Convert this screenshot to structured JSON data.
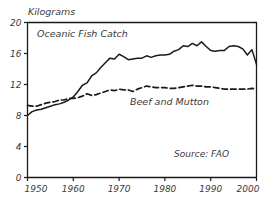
{
  "chart_data": {
    "type": "line",
    "title": "",
    "ylabel": "Kilograms",
    "xlabel": "",
    "xlim": [
      1950,
      2000
    ],
    "ylim": [
      0,
      20
    ],
    "grid": false,
    "legend_position": "inline-annotations",
    "yticks": [
      "0",
      "4",
      "8",
      "12",
      "16",
      "20"
    ],
    "ytick_values": [
      0,
      4,
      8,
      12,
      16,
      20
    ],
    "xticks": [
      "1950",
      "1960",
      "1970",
      "1980",
      "1990",
      "2000"
    ],
    "xtick_values": [
      1950,
      1960,
      1970,
      1980,
      1990,
      2000
    ],
    "annotations": [
      {
        "text": "Oceanic Fish Catch",
        "x": 1962,
        "y": 18.1
      },
      {
        "text": "Beef and Mutton",
        "x": 1981,
        "y": 9.3
      },
      {
        "text": "Source: FAO",
        "x": 1988,
        "y": 2.6
      }
    ],
    "series": [
      {
        "name": "Oceanic Fish Catch",
        "style": "solid",
        "color": "#1a1a1a",
        "x": [
          1950,
          1951,
          1952,
          1953,
          1954,
          1955,
          1956,
          1957,
          1958,
          1959,
          1960,
          1961,
          1962,
          1963,
          1964,
          1965,
          1966,
          1967,
          1968,
          1969,
          1970,
          1971,
          1972,
          1973,
          1974,
          1975,
          1976,
          1977,
          1978,
          1979,
          1980,
          1981,
          1982,
          1983,
          1984,
          1985,
          1986,
          1987,
          1988,
          1989,
          1990,
          1991,
          1992,
          1993,
          1994,
          1995,
          1996,
          1997,
          1998,
          1999,
          2000
        ],
        "values": [
          8.0,
          8.5,
          8.7,
          8.8,
          9.0,
          9.2,
          9.4,
          9.5,
          9.7,
          10.0,
          10.4,
          11.1,
          11.9,
          12.2,
          13.1,
          13.5,
          14.2,
          14.8,
          15.4,
          15.3,
          15.9,
          15.6,
          15.2,
          15.3,
          15.4,
          15.4,
          15.7,
          15.5,
          15.7,
          15.8,
          15.8,
          15.9,
          16.3,
          16.5,
          17.0,
          16.9,
          17.3,
          17.0,
          17.5,
          16.9,
          16.4,
          16.3,
          16.4,
          16.4,
          16.9,
          17.0,
          16.9,
          16.6,
          15.8,
          16.5,
          14.6
        ]
      },
      {
        "name": "Beef and Mutton",
        "style": "dashed",
        "color": "#1a1a1a",
        "x": [
          1950,
          1951,
          1952,
          1953,
          1954,
          1955,
          1956,
          1957,
          1958,
          1959,
          1960,
          1961,
          1962,
          1963,
          1964,
          1965,
          1966,
          1967,
          1968,
          1969,
          1970,
          1971,
          1972,
          1973,
          1974,
          1975,
          1976,
          1977,
          1978,
          1979,
          1980,
          1981,
          1982,
          1983,
          1984,
          1985,
          1986,
          1987,
          1988,
          1989,
          1990,
          1991,
          1992,
          1993,
          1994,
          1995,
          1996,
          1997,
          1998,
          1999,
          2000
        ],
        "values": [
          9.3,
          9.2,
          9.2,
          9.4,
          9.6,
          9.7,
          9.8,
          10.0,
          10.0,
          10.2,
          10.2,
          10.3,
          10.5,
          10.8,
          10.6,
          10.7,
          10.9,
          11.1,
          11.3,
          11.2,
          11.4,
          11.3,
          11.3,
          11.1,
          11.4,
          11.6,
          11.8,
          11.7,
          11.6,
          11.6,
          11.6,
          11.5,
          11.5,
          11.6,
          11.7,
          11.8,
          11.9,
          11.8,
          11.8,
          11.7,
          11.7,
          11.6,
          11.5,
          11.4,
          11.4,
          11.4,
          11.4,
          11.4,
          11.4,
          11.5,
          11.4
        ]
      }
    ]
  }
}
